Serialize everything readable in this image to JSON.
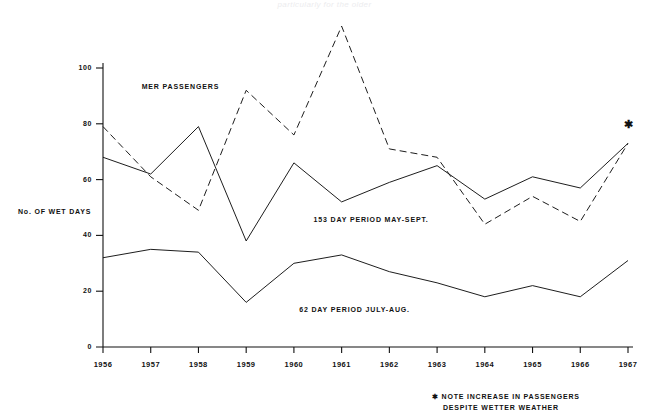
{
  "page": {
    "faint_header_text": "particularly for the older"
  },
  "chart_data": {
    "type": "line",
    "title": "",
    "xlabel": "",
    "ylabel": "No. OF WET DAYS",
    "categories": [
      "1956",
      "1957",
      "1958",
      "1959",
      "1960",
      "1961",
      "1962",
      "1963",
      "1964",
      "1965",
      "1966",
      "1967"
    ],
    "xlim": [
      1956,
      1967
    ],
    "ylim": [
      0,
      100
    ],
    "yticks": [
      0,
      20,
      40,
      60,
      80,
      100
    ],
    "ytick_labels": [
      "0",
      "20",
      "40",
      "60",
      "80",
      "100"
    ],
    "grid": false,
    "legend": "inline-annotations",
    "series": [
      {
        "name": "PIER PASSENGERS",
        "style": "dashed",
        "color": "#111111",
        "values": [
          79,
          61,
          49,
          92,
          76,
          115,
          71,
          68,
          44,
          54,
          45,
          73
        ]
      },
      {
        "name": "153 DAY PERIOD MAY-SEPT.",
        "style": "solid",
        "color": "#111111",
        "values": [
          68,
          62,
          79,
          38,
          66,
          52,
          59,
          65,
          53,
          61,
          57,
          73
        ]
      },
      {
        "name": "62 DAY PERIOD JULY-AUG.",
        "style": "solid",
        "color": "#111111",
        "values": [
          32,
          35,
          34,
          16,
          30,
          33,
          27,
          23,
          18,
          22,
          18,
          31
        ]
      }
    ],
    "annotations": [
      {
        "id": "passengers-label",
        "text": "MER  PASSENGERS",
        "x": 1957.9,
        "y": 93
      },
      {
        "id": "season-153-label",
        "text": "153 DAY PERIOD MAY-SEPT.",
        "x": 1961.5,
        "y": 45
      },
      {
        "id": "season-62-label",
        "text": "62 DAY PERIOD JULY-AUG.",
        "x": 1961.2,
        "y": 13
      },
      {
        "id": "convergence-star",
        "text": "✱",
        "x": 1967.0,
        "y": 80
      }
    ],
    "footnote": {
      "marker": "✱",
      "line1": "NOTE  INCREASE  IN  PASSENGERS",
      "line2": "DESPITE  WETTER  WEATHER"
    }
  }
}
